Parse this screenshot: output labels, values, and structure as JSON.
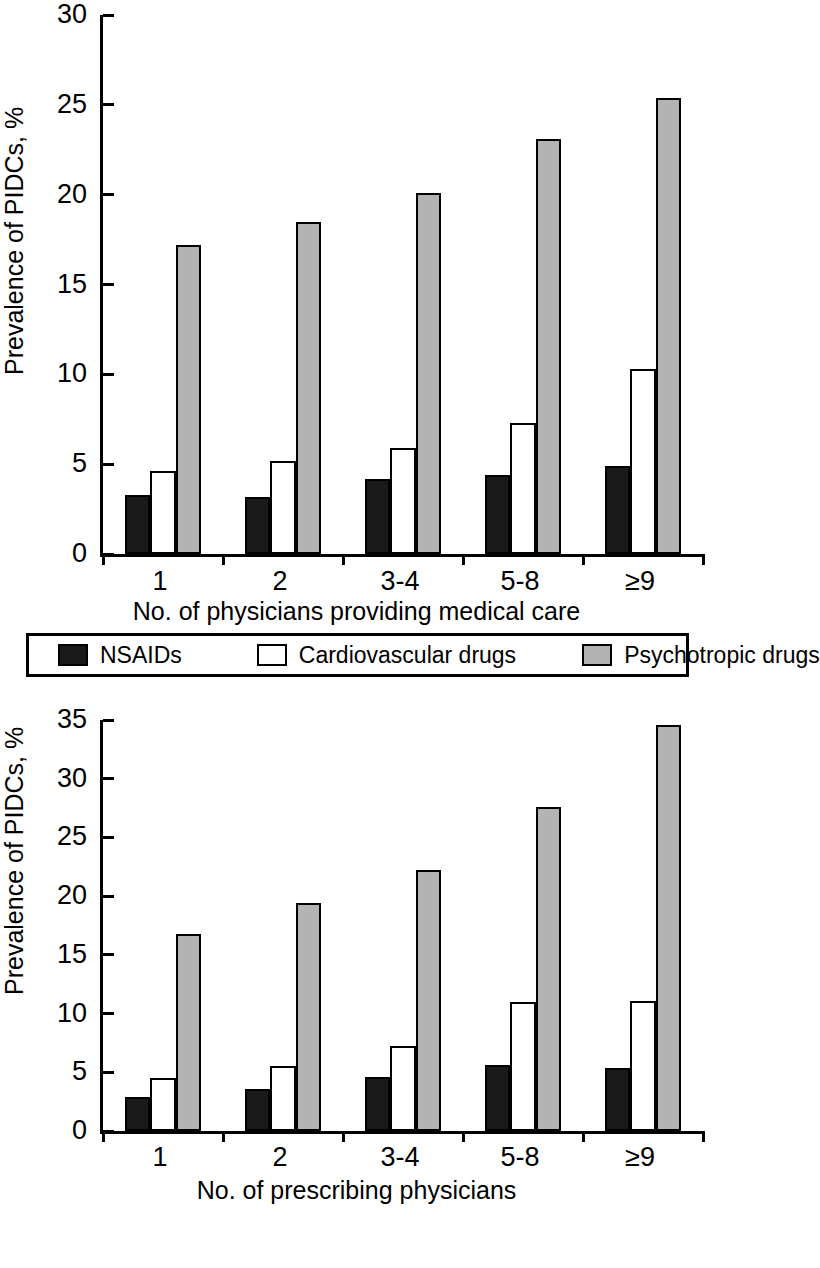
{
  "legend": {
    "position": "between-panels",
    "items": [
      {
        "label": "NSAIDs",
        "color": "#1a1a1a",
        "swatch": "filled-black-square"
      },
      {
        "label": "Cardiovascular drugs",
        "color": "#ffffff",
        "swatch": "outlined-white-square"
      },
      {
        "label": "Psychotropic drugs",
        "color": "#b3b3b3",
        "swatch": "filled-gray-square"
      }
    ]
  },
  "chart_data": [
    {
      "type": "bar",
      "panel": "top",
      "title": "",
      "xlabel": "No. of physicians providing medical care",
      "ylabel": "Prevalence of PIDCs, %",
      "categories": [
        "1",
        "2",
        "3-4",
        "5-8",
        "≥9"
      ],
      "ylim": [
        0,
        30
      ],
      "yticks": [
        0,
        5,
        10,
        15,
        20,
        25,
        30
      ],
      "grid": false,
      "legend_position": "below-panel",
      "series": [
        {
          "name": "NSAIDs",
          "color": "#1a1a1a",
          "values": [
            3.3,
            3.2,
            4.2,
            4.4,
            4.9
          ]
        },
        {
          "name": "Cardiovascular drugs",
          "color": "#ffffff",
          "values": [
            4.6,
            5.2,
            5.9,
            7.3,
            10.3
          ]
        },
        {
          "name": "Psychotropic drugs",
          "color": "#b3b3b3",
          "values": [
            17.2,
            18.5,
            20.1,
            23.1,
            25.4
          ]
        }
      ]
    },
    {
      "type": "bar",
      "panel": "bottom",
      "title": "",
      "xlabel": "No. of prescribing physicians",
      "ylabel": "Prevalence of PIDCs, %",
      "categories": [
        "1",
        "2",
        "3-4",
        "5-8",
        "≥9"
      ],
      "ylim": [
        0,
        35
      ],
      "yticks": [
        0,
        5,
        10,
        15,
        20,
        25,
        30,
        35
      ],
      "grid": false,
      "legend_position": "above-panel",
      "series": [
        {
          "name": "NSAIDs",
          "color": "#1a1a1a",
          "values": [
            2.9,
            3.6,
            4.6,
            5.6,
            5.4
          ]
        },
        {
          "name": "Cardiovascular drugs",
          "color": "#ffffff",
          "values": [
            4.5,
            5.5,
            7.2,
            11.0,
            11.1
          ]
        },
        {
          "name": "Psychotropic drugs",
          "color": "#b3b3b3",
          "values": [
            16.8,
            19.4,
            22.2,
            27.6,
            34.6
          ]
        }
      ]
    }
  ]
}
